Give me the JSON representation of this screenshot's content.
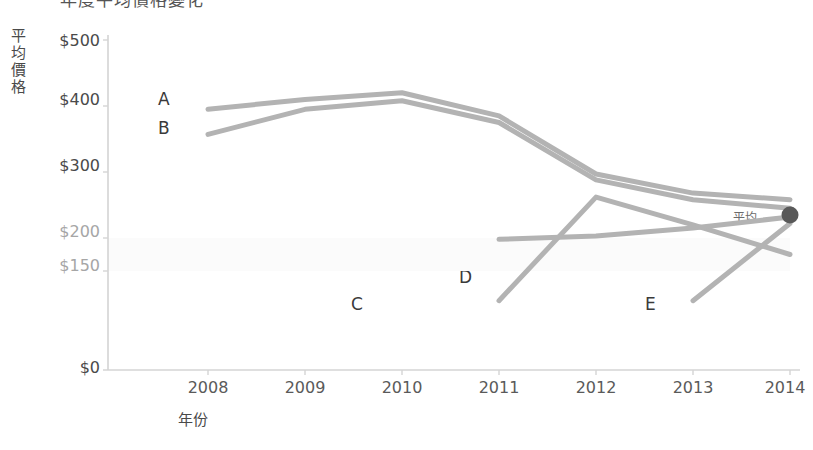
{
  "title": {
    "text": "年度平均價格變化",
    "clipped": true
  },
  "axes": {
    "y_title": "平均價格",
    "x_title": "年份",
    "y_ticks": [
      {
        "label": "$500",
        "value": 500,
        "emphasis": "dark"
      },
      {
        "label": "$400",
        "value": 400,
        "emphasis": "dark"
      },
      {
        "label": "$300",
        "value": 300,
        "emphasis": "dark"
      },
      {
        "label": "$200",
        "value": 200,
        "emphasis": "light"
      },
      {
        "label": "$150",
        "value": 150,
        "emphasis": "light"
      },
      {
        "label": "$0",
        "value": 0,
        "emphasis": "dark"
      }
    ],
    "x_ticks": [
      "2008",
      "2009",
      "2010",
      "2011",
      "2012",
      "2013",
      "2014"
    ]
  },
  "annotations": {
    "band_label": "建議區間",
    "average_label": "平均",
    "average_marker_color": "#595959"
  },
  "series_labels": {
    "a": "A",
    "b": "B",
    "c": "C",
    "d": "D",
    "e": "E"
  },
  "colors": {
    "line": "#b3b3b3",
    "band_fill": "#fbfbfb",
    "axis": "#d4d4d4",
    "text_dark": "#4a4a4a",
    "text_light": "#a6a6a6"
  },
  "chart_data": {
    "type": "line",
    "title": "年度平均價格變化",
    "xlabel": "年份",
    "ylabel": "平均價格",
    "x": [
      2008,
      2009,
      2010,
      2011,
      2012,
      2013,
      2014
    ],
    "ylim": [
      0,
      500
    ],
    "xlim": [
      2008,
      2014
    ],
    "grid": false,
    "legend": "inline-labels",
    "y_tick_values": [
      0,
      150,
      200,
      300,
      400,
      500
    ],
    "recommended_band": {
      "label": "建議區間",
      "low": 150,
      "high": 200
    },
    "average_point": {
      "label": "平均",
      "x": 2014,
      "year": 2014,
      "value": 235
    },
    "series": [
      {
        "name": "A",
        "x": [
          2008,
          2009,
          2010,
          2011,
          2012,
          2013,
          2014
        ],
        "values": [
          395,
          410,
          420,
          385,
          297,
          268,
          258
        ]
      },
      {
        "name": "B",
        "x": [
          2008,
          2009,
          2010,
          2011,
          2012,
          2013,
          2014
        ],
        "values": [
          357,
          395,
          408,
          375,
          288,
          258,
          245
        ]
      },
      {
        "name": "C",
        "x": [
          2011,
          2012,
          2013,
          2014
        ],
        "values": [
          105,
          262,
          220,
          175
        ]
      },
      {
        "name": "D",
        "x": [
          2011,
          2012,
          2013,
          2014
        ],
        "values": [
          198,
          203,
          215,
          232
        ]
      },
      {
        "name": "E",
        "x": [
          2013,
          2014
        ],
        "values": [
          105,
          222
        ]
      }
    ]
  }
}
